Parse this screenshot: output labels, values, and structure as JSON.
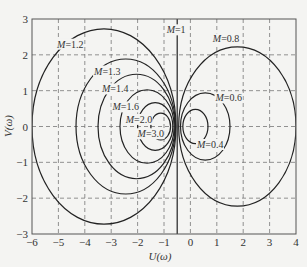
{
  "chart_data": {
    "type": "line",
    "title": "",
    "xlabel": "U(ω)",
    "ylabel": "V(ω)",
    "xlim": [
      -6,
      4
    ],
    "ylim": [
      -3,
      3
    ],
    "xticks": [
      -6,
      -5,
      -4,
      -3,
      -2,
      -1,
      0,
      1,
      2,
      3,
      4
    ],
    "yticks": [
      -3,
      -2,
      -1,
      0,
      1,
      2,
      3
    ],
    "grid": true,
    "grid_style": "dashed",
    "legend": null,
    "series": [
      {
        "name": "M=1.2",
        "label": "M=1.2",
        "shape": "circle",
        "center": [
          -3.273,
          0
        ],
        "radius": 2.727,
        "label_pos": [
          -5.05,
          2.2
        ]
      },
      {
        "name": "M=1.3",
        "label": "M=1.3",
        "shape": "circle",
        "center": [
          -2.449,
          0
        ],
        "radius": 1.884,
        "label_pos": [
          -3.65,
          1.45
        ]
      },
      {
        "name": "M=1.4",
        "label": "M=1.4",
        "shape": "circle",
        "center": [
          -2.042,
          0
        ],
        "radius": 1.458,
        "label_pos": [
          -3.35,
          0.95
        ]
      },
      {
        "name": "M=1.6",
        "label": "M=1.6",
        "shape": "circle",
        "center": [
          -1.641,
          0
        ],
        "radius": 1.026,
        "label_pos": [
          -2.95,
          0.45
        ]
      },
      {
        "name": "M=2.0",
        "label": "M=2.0",
        "shape": "circle",
        "center": [
          -1.333,
          0
        ],
        "radius": 0.667,
        "label_pos": [
          -2.45,
          0.1
        ]
      },
      {
        "name": "M=3.0",
        "label": "M=3.0",
        "shape": "circle",
        "center": [
          -1.125,
          0
        ],
        "radius": 0.375,
        "label_pos": [
          -2.0,
          -0.3
        ]
      },
      {
        "name": "M=1",
        "label": "M=1",
        "shape": "vline",
        "x": -0.5,
        "label_pos": [
          -0.9,
          2.6
        ]
      },
      {
        "name": "M=0.8",
        "label": "M=0.8",
        "shape": "circle",
        "center": [
          1.778,
          0
        ],
        "radius": 2.222,
        "label_pos": [
          0.85,
          2.35
        ]
      },
      {
        "name": "M=0.6",
        "label": "M=0.6",
        "shape": "circle",
        "center": [
          0.5625,
          0
        ],
        "radius": 0.9375,
        "label_pos": [
          0.95,
          0.7
        ]
      },
      {
        "name": "M=0.4",
        "label": "M=0.4",
        "shape": "circle",
        "center": [
          0.19,
          0
        ],
        "radius": 0.476,
        "label_pos": [
          0.25,
          -0.6
        ]
      }
    ]
  },
  "colors": {
    "background": "#f4f4f2",
    "frame": "#555555",
    "grid": "#777777",
    "curve": "#222222",
    "text": "#333333"
  }
}
